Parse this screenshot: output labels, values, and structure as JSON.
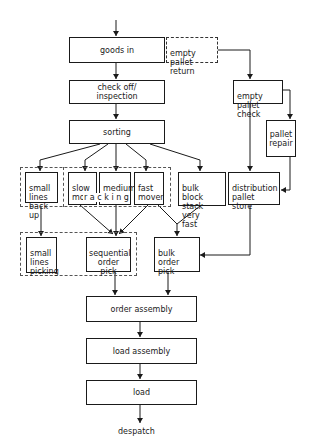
{
  "diagram": {
    "type": "flowchart",
    "title": "",
    "nodes": {
      "goods_in": "goods in",
      "empty_pallet_return": "empty pallet\nreturn",
      "check_off": "check off/\ninspection",
      "empty_pallet_check": "empty pallet\ncheck",
      "sorting": "sorting",
      "pallet_repair": "pallet\nrepair",
      "small_lines_back_up": "small\nlines\nback up",
      "slow_mover": "slow\nmover",
      "medium_mover": "medium\nmover",
      "fast_mover": "fast\nmover",
      "racking_label": "r a c k i n g",
      "bulk_block": "bulk block\nstack very\nfast",
      "distribution_pallet_store": "distribution\npallet\nstore",
      "small_lines_picking": "small\nlines\npicking",
      "sequential_order_pick": "sequential\norder pick",
      "bulk_order_pick": "bulk order\npick",
      "order_assembly": "order assembly",
      "load_assembly": "load assembly",
      "load": "load",
      "despatch": "despatch"
    },
    "edges": [
      [
        "start",
        "goods_in"
      ],
      [
        "goods_in",
        "check_off"
      ],
      [
        "empty_pallet_return",
        "empty_pallet_check"
      ],
      [
        "check_off",
        "sorting"
      ],
      [
        "empty_pallet_check",
        "pallet_repair"
      ],
      [
        "empty_pallet_check",
        "distribution_pallet_store"
      ],
      [
        "pallet_repair",
        "distribution_pallet_store"
      ],
      [
        "sorting",
        "small_lines_back_up"
      ],
      [
        "sorting",
        "slow_mover"
      ],
      [
        "sorting",
        "medium_mover"
      ],
      [
        "sorting",
        "fast_mover"
      ],
      [
        "sorting",
        "bulk_block"
      ],
      [
        "small_lines_back_up",
        "small_lines_picking"
      ],
      [
        "slow_mover",
        "sequential_order_pick"
      ],
      [
        "medium_mover",
        "sequential_order_pick"
      ],
      [
        "fast_mover",
        "sequential_order_pick"
      ],
      [
        "fast_mover",
        "bulk_order_pick"
      ],
      [
        "bulk_block",
        "bulk_order_pick"
      ],
      [
        "distribution_pallet_store",
        "bulk_order_pick"
      ],
      [
        "sequential_order_pick",
        "order_assembly"
      ],
      [
        "bulk_order_pick",
        "order_assembly"
      ],
      [
        "order_assembly",
        "load_assembly"
      ],
      [
        "load_assembly",
        "load"
      ],
      [
        "load",
        "despatch"
      ]
    ]
  }
}
